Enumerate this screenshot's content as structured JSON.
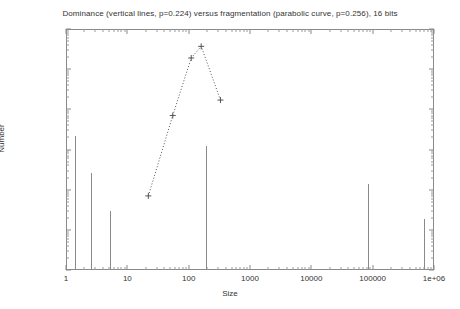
{
  "chart_data": {
    "type": "line",
    "title": "Dominance (vertical lines, p=0.224) versus fragmentation (parabolic curve, p=0.256), 16 bits",
    "xlabel": "Size",
    "ylabel": "Number",
    "xscale": "log",
    "yscale": "log",
    "xlim": [
      1,
      1000000
    ],
    "ylim": [
      0.1,
      100000
    ],
    "grid": false,
    "legend": "none",
    "xticks": [
      "1",
      "10",
      "100",
      "1000",
      "10000",
      "100000",
      "1e+06"
    ],
    "xtick_values": [
      1,
      10,
      100,
      1000,
      10000,
      100000,
      1000000
    ],
    "yticks": [
      "0.1",
      "1",
      "10",
      "100",
      "1000",
      "10000",
      "100000"
    ],
    "ytick_values": [
      0.1,
      1,
      10,
      100,
      1000,
      10000,
      100000
    ],
    "series": [
      {
        "name": "Dominance (vertical lines, p=0.224)",
        "type": "impulse",
        "marker": "none",
        "linestyle": "solid",
        "color": "#8a8a8a",
        "points": [
          {
            "x": 1.4,
            "y": 220
          },
          {
            "x": 2.6,
            "y": 26
          },
          {
            "x": 5.2,
            "y": 3.0
          },
          {
            "x": 190,
            "y": 120
          },
          {
            "x": 85000,
            "y": 14
          },
          {
            "x": 700000,
            "y": 1.9
          }
        ]
      },
      {
        "name": "Fragmentation (parabolic curve, p=0.256)",
        "type": "line",
        "marker": "plus",
        "linestyle": "dotted",
        "color": "#555555",
        "points": [
          {
            "x": 22,
            "y": 7
          },
          {
            "x": 55,
            "y": 700
          },
          {
            "x": 110,
            "y": 19000
          },
          {
            "x": 160,
            "y": 37000
          },
          {
            "x": 330,
            "y": 1700
          }
        ]
      }
    ]
  }
}
